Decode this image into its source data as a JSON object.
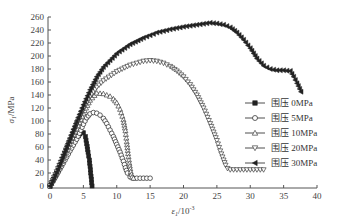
{
  "chart_data": {
    "type": "line",
    "title": "",
    "xlabel": "ε1/10⁻³",
    "ylabel": "σ1/MPa",
    "xlim": [
      0,
      40
    ],
    "ylim": [
      0,
      260
    ],
    "xticks": [
      0,
      5,
      10,
      15,
      20,
      25,
      30,
      35,
      40
    ],
    "yticks": [
      0,
      20,
      40,
      60,
      80,
      100,
      120,
      140,
      160,
      180,
      200,
      220,
      240,
      260
    ],
    "grid": false,
    "legend_position": "right-middle",
    "series": [
      {
        "name": "围压 0MPa",
        "marker": "filled-square",
        "x": [
          0,
          0.5,
          1,
          1.5,
          2,
          2.5,
          3,
          3.5,
          4,
          4.5,
          5,
          5.3,
          5.5,
          5.7,
          5.9,
          6.0,
          6.1,
          6.2,
          6.3
        ],
        "y": [
          0,
          10,
          20,
          30,
          40,
          50,
          58,
          66,
          74,
          80,
          82,
          76,
          65,
          52,
          40,
          30,
          20,
          10,
          0
        ]
      },
      {
        "name": "围压 5MPa",
        "marker": "open-circle",
        "x": [
          0,
          1,
          2,
          3,
          4,
          5,
          5.5,
          6,
          6.5,
          7,
          7.5,
          8,
          8.5,
          9,
          9.5,
          10,
          10.5,
          11,
          11.3,
          11.6,
          12,
          12.5,
          13,
          13.5,
          14,
          14.5,
          15
        ],
        "y": [
          0,
          17,
          35,
          54,
          72,
          95,
          105,
          111,
          113,
          112,
          109,
          104,
          96,
          86,
          76,
          64,
          52,
          38,
          28,
          20,
          14,
          12,
          12,
          12,
          12,
          12,
          12
        ]
      },
      {
        "name": "围压 10MPa",
        "marker": "open-triangle-up",
        "x": [
          0,
          1,
          2,
          3,
          4,
          5,
          6,
          7,
          8,
          9,
          9.5,
          10,
          10.5,
          11,
          11.3,
          11.5,
          11.7,
          11.9,
          12.1,
          12.3,
          12.5
        ],
        "y": [
          0,
          20,
          42,
          65,
          88,
          112,
          132,
          143,
          142,
          138,
          134,
          128,
          118,
          102,
          85,
          68,
          50,
          35,
          22,
          14,
          12
        ]
      },
      {
        "name": "围压 20MPa",
        "marker": "open-triangle-down",
        "x": [
          0,
          1,
          2,
          3,
          4,
          5,
          6,
          7,
          8,
          10,
          12,
          14,
          15,
          16,
          17,
          18,
          19,
          20,
          21,
          22,
          23,
          24,
          25,
          25.5,
          26,
          26.3,
          26.6,
          27,
          28,
          29,
          30,
          31,
          32
        ],
        "y": [
          0,
          22,
          46,
          70,
          95,
          118,
          138,
          152,
          162,
          176,
          186,
          192,
          193,
          192,
          189,
          184,
          177,
          168,
          156,
          140,
          120,
          96,
          70,
          54,
          40,
          32,
          27,
          25,
          25,
          25,
          25,
          25,
          25
        ]
      },
      {
        "name": "围压 30MPa",
        "marker": "filled-triangle-left",
        "x": [
          0,
          1,
          2,
          3,
          4,
          5,
          6,
          7,
          8,
          10,
          12,
          14,
          16,
          18,
          20,
          22,
          24,
          25,
          26,
          27,
          28,
          29,
          30,
          31,
          32,
          33,
          34,
          35,
          36,
          36.5,
          37,
          37.6
        ],
        "y": [
          0,
          22,
          48,
          74,
          100,
          125,
          148,
          168,
          183,
          204,
          218,
          228,
          236,
          241,
          245,
          248,
          251,
          250,
          248,
          244,
          236,
          225,
          212,
          196,
          185,
          180,
          178,
          178,
          177,
          168,
          158,
          145
        ]
      }
    ]
  },
  "axes": {
    "x_title_main": "ε",
    "x_title_sub": "1",
    "x_title_unit": "/10",
    "x_title_exp": "-3",
    "y_title_main": "σ",
    "y_title_sub": "1",
    "y_title_unit": "/MPa"
  },
  "legend": {
    "items": [
      {
        "label": "围压 0MPa"
      },
      {
        "label": "围压 5MPa"
      },
      {
        "label": "围压 10MPa"
      },
      {
        "label": "围压 20MPa"
      },
      {
        "label": "围压 30MPa"
      }
    ]
  },
  "colors": {
    "line": "#222222",
    "axis": "#555555"
  }
}
